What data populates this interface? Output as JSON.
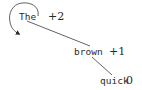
{
  "diagram": {
    "type": "dependency-tree",
    "nodes": [
      {
        "id": "the",
        "word": "The",
        "score": "+2",
        "is_root": true
      },
      {
        "id": "brown",
        "word": "brown",
        "score": "+1"
      },
      {
        "id": "quick",
        "word": "quick",
        "score": "0"
      }
    ],
    "edges": [
      {
        "from": "the",
        "to": "brown"
      },
      {
        "from": "brown",
        "to": "quick"
      }
    ],
    "root_loop": {
      "node": "the",
      "icon": "self-loop-arrow-icon"
    }
  }
}
